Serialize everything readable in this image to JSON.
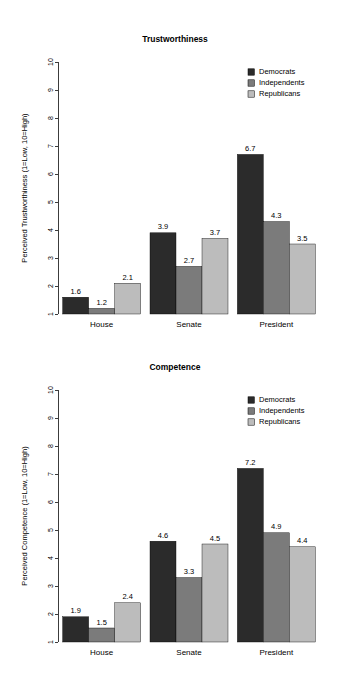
{
  "page": {
    "background": "#ffffff",
    "width": 349,
    "height": 677
  },
  "palette": {
    "democrats": "#2b2b2b",
    "independents": "#7b7b7b",
    "republicans": "#bcbcbc",
    "axis": "#3c3c3c",
    "text": "#000000"
  },
  "charts": [
    {
      "id": "trustworthiness",
      "title": "Trustworthiness",
      "ylabel": "Perceived Trustworthiness (1=Low, 10=High)",
      "xlabel": "",
      "ylim": [
        1,
        10
      ],
      "yticks": [
        "1",
        "2",
        "3",
        "4",
        "5",
        "6",
        "7",
        "8",
        "9",
        "10"
      ],
      "categories": [
        "House",
        "Senate",
        "President"
      ],
      "legend": [
        "Democrats",
        "Independents",
        "Republicans"
      ],
      "series": [
        {
          "name": "Democrats",
          "values": [
            1.6,
            3.9,
            6.7
          ]
        },
        {
          "name": "Independents",
          "values": [
            1.2,
            2.7,
            4.3
          ]
        },
        {
          "name": "Republicans",
          "values": [
            2.1,
            3.7,
            3.5
          ]
        }
      ]
    },
    {
      "id": "competence",
      "title": "Competence",
      "ylabel": "Perceived Competence (1=Low, 10=High)",
      "xlabel": "",
      "ylim": [
        1,
        10
      ],
      "yticks": [
        "1",
        "2",
        "3",
        "4",
        "5",
        "6",
        "7",
        "8",
        "9",
        "10"
      ],
      "categories": [
        "House",
        "Senate",
        "President"
      ],
      "legend": [
        "Democrats",
        "Independents",
        "Republicans"
      ],
      "series": [
        {
          "name": "Democrats",
          "values": [
            1.9,
            4.6,
            7.2
          ]
        },
        {
          "name": "Independents",
          "values": [
            1.5,
            3.3,
            4.9
          ]
        },
        {
          "name": "Republicans",
          "values": [
            2.4,
            4.5,
            4.4
          ]
        }
      ]
    }
  ],
  "chart_data": [
    {
      "type": "bar",
      "title": "Trustworthiness",
      "xlabel": "",
      "ylabel": "Perceived Trustworthiness (1=Low, 10=High)",
      "ylim": [
        1,
        10
      ],
      "grid": false,
      "legend_position": "top-right",
      "categories": [
        "House",
        "Senate",
        "President"
      ],
      "series": [
        {
          "name": "Democrats",
          "values": [
            1.6,
            3.9,
            6.7
          ]
        },
        {
          "name": "Independents",
          "values": [
            1.2,
            2.7,
            4.3
          ]
        },
        {
          "name": "Republicans",
          "values": [
            2.1,
            3.7,
            3.5
          ]
        }
      ]
    },
    {
      "type": "bar",
      "title": "Competence",
      "xlabel": "",
      "ylabel": "Perceived Competence (1=Low, 10=High)",
      "ylim": [
        1,
        10
      ],
      "grid": false,
      "legend_position": "top-right",
      "categories": [
        "House",
        "Senate",
        "President"
      ],
      "series": [
        {
          "name": "Democrats",
          "values": [
            1.9,
            4.6,
            7.2
          ]
        },
        {
          "name": "Independents",
          "values": [
            1.5,
            3.3,
            4.9
          ]
        },
        {
          "name": "Republicans",
          "values": [
            2.4,
            4.5,
            4.4
          ]
        }
      ]
    }
  ]
}
